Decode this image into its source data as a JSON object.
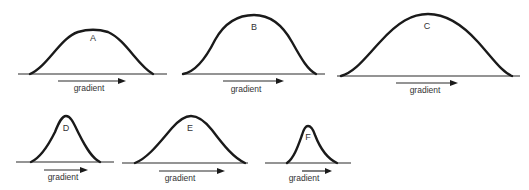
{
  "axis_label": "gradient",
  "panels": [
    {
      "id": "A",
      "label": "A",
      "axis_label": "gradient",
      "shape": "moderate width, moderate height"
    },
    {
      "id": "B",
      "label": "B",
      "axis_label": "gradient",
      "shape": "moderate width, tall"
    },
    {
      "id": "C",
      "label": "C",
      "axis_label": "gradient",
      "shape": "wide, tall"
    },
    {
      "id": "D",
      "label": "D",
      "axis_label": "gradient",
      "shape": "narrow, tall, skewed"
    },
    {
      "id": "E",
      "label": "E",
      "axis_label": "gradient",
      "shape": "wide, tall"
    },
    {
      "id": "F",
      "label": "F",
      "axis_label": "gradient",
      "shape": "narrow, moderate height"
    }
  ],
  "colors": {
    "stroke": "#1a1a1a",
    "background": "#ffffff"
  }
}
